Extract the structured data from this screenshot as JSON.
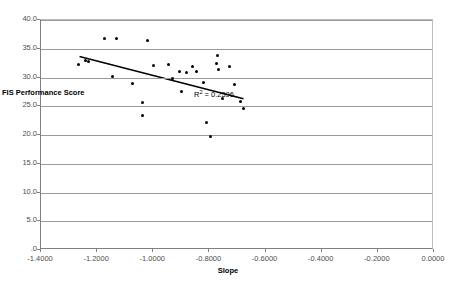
{
  "chart_data": {
    "type": "scatter",
    "title": "",
    "xlabel": "Slope",
    "ylabel": "FIS Performance Score",
    "xlim": [
      -1.4,
      0.0
    ],
    "ylim": [
      0.0,
      40.0
    ],
    "xticks": [
      "-1.4000",
      "-1.2000",
      "-1.0000",
      "-0.8000",
      "-0.6000",
      "-0.4000",
      "-0.2000",
      "0.0000"
    ],
    "xtick_values": [
      -1.4,
      -1.2,
      -1.0,
      -0.8,
      -0.6,
      -0.4,
      -0.2,
      0.0
    ],
    "yticks": [
      "40.0",
      "35.0",
      "30.0",
      "25.0",
      "20.0",
      "15.0",
      "10.0",
      "5.0",
      ".0"
    ],
    "ytick_values": [
      40.0,
      35.0,
      30.0,
      25.0,
      20.0,
      15.0,
      10.0,
      5.0,
      0.0
    ],
    "grid": "horizontal",
    "legend": "none",
    "marker_color": "#000000",
    "gridline_color": "#9a9a9a",
    "series": [
      {
        "name": "FIS Performance Score vs Slope",
        "points": [
          [
            -1.265,
            32.3
          ],
          [
            -1.24,
            33.0
          ],
          [
            -1.175,
            36.7
          ],
          [
            -1.13,
            36.8
          ],
          [
            -1.232,
            32.8
          ],
          [
            -1.145,
            30.1
          ],
          [
            -1.075,
            28.9
          ],
          [
            -1.04,
            25.6
          ],
          [
            -1.038,
            23.4
          ],
          [
            -1.02,
            36.4
          ],
          [
            -1.0,
            32.1
          ],
          [
            -0.945,
            32.2
          ],
          [
            -0.93,
            29.9
          ],
          [
            -0.905,
            31.0
          ],
          [
            -0.9,
            27.6
          ],
          [
            -0.88,
            30.8
          ],
          [
            -0.862,
            32.0
          ],
          [
            -0.845,
            31.1
          ],
          [
            -0.82,
            29.2
          ],
          [
            -0.81,
            22.2
          ],
          [
            -0.795,
            19.7
          ],
          [
            -0.775,
            32.5
          ],
          [
            -0.772,
            33.9
          ],
          [
            -0.768,
            31.4
          ],
          [
            -0.752,
            26.4
          ],
          [
            -0.728,
            32.0
          ],
          [
            -0.712,
            28.8
          ],
          [
            -0.69,
            25.9
          ],
          [
            -0.678,
            24.6
          ]
        ]
      }
    ],
    "trendline": {
      "type": "linear",
      "x_start": -1.262,
      "y_start": 33.6,
      "x_end": -0.675,
      "y_end": 26.2,
      "color": "#000000"
    },
    "annotations": [
      {
        "name": "r-squared",
        "prefix": "R",
        "superscript": "2",
        "suffix": " = 0.2596",
        "x": -0.855,
        "y": 26.9
      }
    ]
  }
}
